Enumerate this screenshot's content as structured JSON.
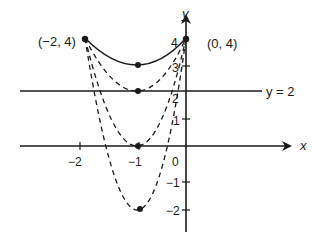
{
  "diagram": {
    "type": "function-graph",
    "axes": {
      "x_label": "x",
      "y_label": "y",
      "x_ticks": [
        {
          "value": -2,
          "label": "−2"
        },
        {
          "value": -1,
          "label": "−1"
        },
        {
          "value": 0,
          "label": "0"
        }
      ],
      "y_ticks": [
        {
          "value": 4,
          "label": "4"
        },
        {
          "value": 3,
          "label": "3"
        },
        {
          "value": 2,
          "label": "2"
        },
        {
          "value": 1,
          "label": "1"
        },
        {
          "value": -1,
          "label": "−1"
        },
        {
          "value": -2,
          "label": "−2"
        }
      ]
    },
    "horizontal_line": {
      "y": 2,
      "label": "y = 2"
    },
    "point_labels": {
      "left": "(−2, 4)",
      "right": "(0, 4)"
    },
    "curves": [
      {
        "name": "solid-parabola",
        "style": "solid",
        "vertex": [
          -1,
          3
        ],
        "through": [
          [
            -2,
            4
          ],
          [
            0,
            4
          ]
        ]
      },
      {
        "name": "dashed-parabola-vertex-2",
        "style": "dashed",
        "vertex": [
          -1,
          2
        ],
        "through": [
          [
            -2,
            4
          ],
          [
            0,
            4
          ]
        ]
      },
      {
        "name": "dashed-parabola-vertex-0",
        "style": "dashed",
        "vertex": [
          -1,
          0
        ],
        "through": [
          [
            -2,
            4
          ],
          [
            0,
            4
          ]
        ]
      },
      {
        "name": "dashed-parabola-vertex-neg2",
        "style": "dashed",
        "vertex": [
          -1,
          -2
        ],
        "through": [
          [
            -2,
            4
          ],
          [
            0,
            4
          ]
        ]
      }
    ],
    "points": [
      {
        "name": "point-neg2-4",
        "coords": [
          -2,
          4
        ]
      },
      {
        "name": "point-0-4",
        "coords": [
          0,
          4
        ]
      },
      {
        "name": "vertex-neg1-3",
        "coords": [
          -1,
          3
        ]
      },
      {
        "name": "vertex-neg1-2",
        "coords": [
          -1,
          2
        ]
      },
      {
        "name": "vertex-neg1-0",
        "coords": [
          -1,
          0
        ]
      },
      {
        "name": "vertex-neg1-neg2",
        "coords": [
          -1,
          -2
        ]
      }
    ],
    "colors": {
      "ink": "#1a1a1a",
      "background": "#ffffff"
    }
  }
}
